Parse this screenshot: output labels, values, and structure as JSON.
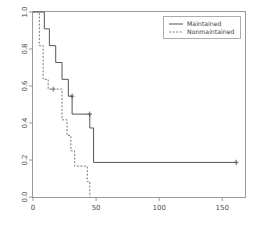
{
  "chart_data": {
    "type": "line",
    "title": "",
    "subtitle": "",
    "xlabel": "",
    "ylabel": "",
    "xlim": [
      0,
      168
    ],
    "ylim": [
      0.0,
      1.0
    ],
    "grid": false,
    "plot_style": "step-post",
    "legend_position": "top-right",
    "xticks": [
      0,
      50,
      100,
      150
    ],
    "xtick_labels": [
      "0",
      "50",
      "100",
      "150"
    ],
    "yticks": [
      0.0,
      0.2,
      0.4,
      0.6,
      0.8,
      1.0
    ],
    "ytick_labels": [
      "0.0",
      "0.2",
      "0.4",
      "0.6",
      "0.8",
      "1.0"
    ],
    "legend": [
      "Maintained",
      "Nonmaintained"
    ],
    "series": [
      {
        "name": "Maintained",
        "linestyle": "solid",
        "color": "#555555",
        "x": [
          0,
          9,
          13,
          18,
          23,
          28,
          31,
          34,
          45,
          48,
          161
        ],
        "y": [
          1.0,
          1.0,
          0.909,
          0.818,
          0.727,
          0.636,
          0.545,
          0.448,
          0.448,
          0.373,
          0.187
        ],
        "step_x": [
          0,
          9,
          13,
          18,
          23,
          28,
          31,
          34,
          45,
          48,
          161
        ],
        "step_y": [
          1.0,
          0.909,
          0.818,
          0.727,
          0.636,
          0.545,
          0.448,
          0.448,
          0.373,
          0.187,
          0.187
        ],
        "censored_x": [
          31,
          45,
          161
        ],
        "censored_y": [
          0.545,
          0.448,
          0.187
        ]
      },
      {
        "name": "Nonmaintained",
        "linestyle": "dashed",
        "color": "#777777",
        "x": [
          0,
          5,
          8,
          12,
          16,
          23,
          27,
          30,
          33,
          43,
          45
        ],
        "y": [
          1.0,
          1.0,
          0.818,
          0.727,
          0.636,
          0.583,
          0.417,
          0.333,
          0.25,
          0.167,
          0.083
        ],
        "step_x": [
          0,
          5,
          8,
          12,
          16,
          23,
          27,
          30,
          33,
          43,
          45
        ],
        "step_y": [
          1.0,
          0.818,
          0.636,
          0.583,
          0.583,
          0.417,
          0.333,
          0.25,
          0.167,
          0.083,
          0.0
        ],
        "censored_x": [
          16
        ],
        "censored_y": [
          0.583
        ]
      }
    ]
  },
  "axes": {
    "x_tick_labels": [
      "0",
      "50",
      "100",
      "150"
    ],
    "y_tick_labels": [
      "0.0",
      "0.2",
      "0.4",
      "0.6",
      "0.8",
      "1.0"
    ]
  },
  "legend": {
    "entries": [
      {
        "label": "Maintained",
        "style": "solid"
      },
      {
        "label": "Nonmaintained",
        "style": "dashed"
      }
    ]
  },
  "colors": {
    "axis": "#808080",
    "solid_line": "#555555",
    "dashed_line": "#7d7d7d",
    "text": "#444444",
    "background": "#ffffff"
  }
}
